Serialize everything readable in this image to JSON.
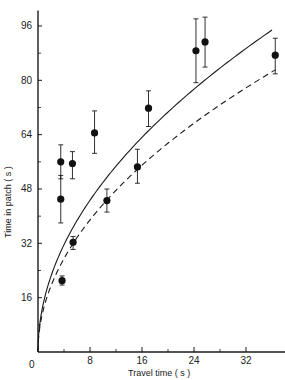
{
  "chart_data": {
    "type": "scatter",
    "title": "",
    "xlabel": "Travel time ( s )",
    "ylabel": "Time in patch ( s )",
    "xlim": [
      0,
      38
    ],
    "ylim": [
      0,
      100
    ],
    "grid": false,
    "legend": null,
    "x_ticks": [
      0,
      8,
      16,
      24,
      32
    ],
    "x_minor_ticks": [
      4,
      12,
      20,
      28
    ],
    "y_ticks": [
      16,
      32,
      48,
      64,
      80,
      96
    ],
    "y_minor_ticks": [
      8,
      24,
      40,
      56,
      72,
      88
    ],
    "origin_label": "0",
    "points": [
      {
        "x": 3.5,
        "y": 56,
        "err_low": 51,
        "err_high": 61
      },
      {
        "x": 3.5,
        "y": 45,
        "err_low": 38,
        "err_high": 52
      },
      {
        "x": 3.7,
        "y": 21,
        "err_low": 19.7,
        "err_high": 22.4
      },
      {
        "x": 5.3,
        "y": 55.5,
        "err_low": 51,
        "err_high": 59
      },
      {
        "x": 5.4,
        "y": 32.3,
        "err_low": 30.2,
        "err_high": 34
      },
      {
        "x": 8.7,
        "y": 64.5,
        "err_low": 58.5,
        "err_high": 71
      },
      {
        "x": 10.6,
        "y": 44.6,
        "err_low": 41.2,
        "err_high": 48
      },
      {
        "x": 15.3,
        "y": 54.5,
        "err_low": 49.7,
        "err_high": 59.7
      },
      {
        "x": 17.0,
        "y": 71.8,
        "err_low": 66.4,
        "err_high": 76.9
      },
      {
        "x": 24.3,
        "y": 88.7,
        "err_low": 79.3,
        "err_high": 98.1
      },
      {
        "x": 25.7,
        "y": 91.3,
        "err_low": 83.9,
        "err_high": 98.6
      },
      {
        "x": 36.5,
        "y": 87.4,
        "err_low": 81.9,
        "err_high": 92.4
      }
    ],
    "series": [
      {
        "name": "solid curve",
        "style": "solid",
        "model": "y = 15.8 * sqrt(x)",
        "coef": 15.8,
        "exponent": 0.5,
        "x_range": [
          0,
          36
        ]
      },
      {
        "name": "dashed curve",
        "style": "dashed",
        "model": "y = 13.75 * sqrt(x)",
        "coef": 13.75,
        "exponent": 0.5,
        "x_range": [
          0,
          36.5
        ]
      }
    ]
  },
  "labels": {
    "x_axis": "Travel time ( s )",
    "y_axis": "Time in patch ( s )",
    "origin": "0"
  }
}
